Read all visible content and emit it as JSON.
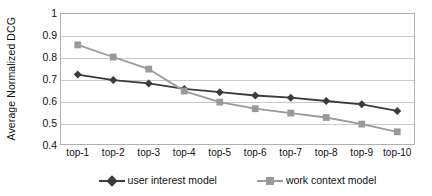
{
  "chart_data": {
    "type": "line",
    "title": "",
    "xlabel": "",
    "ylabel": "Average Normalized DCG",
    "categories": [
      "top-1",
      "top-2",
      "top-3",
      "top-4",
      "top-5",
      "top-6",
      "top-7",
      "top-8",
      "top-9",
      "top-10"
    ],
    "ylim": [
      0.4,
      1.0
    ],
    "ytick_labels": [
      "1",
      "0.9",
      "0.8",
      "0.7",
      "0.6",
      "0.5",
      "0.4"
    ],
    "yticks": [
      1.0,
      0.9,
      0.8,
      0.7,
      0.6,
      0.5,
      0.4
    ],
    "grid": true,
    "legend_position": "bottom",
    "series": [
      {
        "name": "user interest model",
        "color": "#3b3b3b",
        "marker": "diamond",
        "values": [
          0.72,
          0.695,
          0.68,
          0.655,
          0.64,
          0.625,
          0.615,
          0.6,
          0.585,
          0.555
        ]
      },
      {
        "name": "work context model",
        "color": "#9a9a9a",
        "marker": "square",
        "values": [
          0.855,
          0.8,
          0.745,
          0.645,
          0.595,
          0.565,
          0.545,
          0.525,
          0.495,
          0.46
        ]
      }
    ]
  },
  "colors": {
    "series_user_interest": "#3b3b3b",
    "series_work_context": "#9a9a9a",
    "gridline": "#c9c9c9",
    "frame": "#b0b0b0",
    "text": "#111111",
    "background": "#ffffff"
  }
}
